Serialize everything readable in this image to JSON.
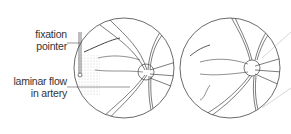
{
  "labels": {
    "fixation_line1": "fixation",
    "fixation_line2": "pointer",
    "laminar_line1": "laminar flow",
    "laminar_line2": "in artery"
  },
  "figures": [
    {
      "name": "left-fundus",
      "description": "retina with fixation pointer and laminar flow"
    },
    {
      "name": "right-fundus",
      "description": "retina"
    }
  ]
}
